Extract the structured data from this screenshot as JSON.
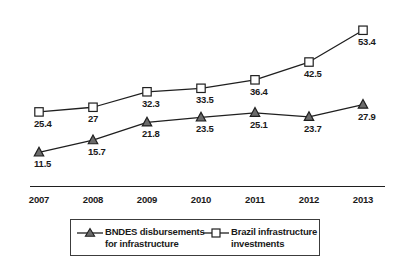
{
  "chart_data": {
    "type": "line",
    "title": "",
    "xlabel": "",
    "ylabel": "",
    "categories": [
      "2007",
      "2008",
      "2009",
      "2010",
      "2011",
      "2012",
      "2013"
    ],
    "x": [
      2007,
      2008,
      2009,
      2010,
      2011,
      2012,
      2013
    ],
    "ylim": [
      0,
      60
    ],
    "grid": false,
    "legend_position": "bottom",
    "series": [
      {
        "name": "BNDES disbursements for infrastructure",
        "marker": "triangle",
        "marker_fill": "#6b6b6b",
        "marker_stroke": "#1f1f1f",
        "line_color": "#1f1f1f",
        "values": [
          11.5,
          15.7,
          21.8,
          23.5,
          25.1,
          23.7,
          27.9
        ],
        "labels": [
          "11.5",
          "15.7",
          "21.8",
          "23.5",
          "25.1",
          "23.7",
          "27.9"
        ]
      },
      {
        "name": "Brazil infrastructure investments",
        "marker": "square",
        "marker_fill": "#ffffff",
        "marker_stroke": "#1f1f1f",
        "line_color": "#1f1f1f",
        "values": [
          25.4,
          27,
          32.3,
          33.5,
          36.4,
          42.5,
          53.4
        ],
        "labels": [
          "25.4",
          "27",
          "32.3",
          "33.5",
          "36.4",
          "42.5",
          "53.4"
        ]
      }
    ]
  },
  "axis": {
    "tick_labels": [
      "2007",
      "2008",
      "2009",
      "2010",
      "2011",
      "2012",
      "2013"
    ]
  },
  "legend": {
    "entries": [
      {
        "label": "BNDES disbursements\nfor infrastructure",
        "marker": "triangle-marker-icon"
      },
      {
        "label": "Brazil infrastructure\ninvestments",
        "marker": "square-marker-icon"
      }
    ]
  }
}
